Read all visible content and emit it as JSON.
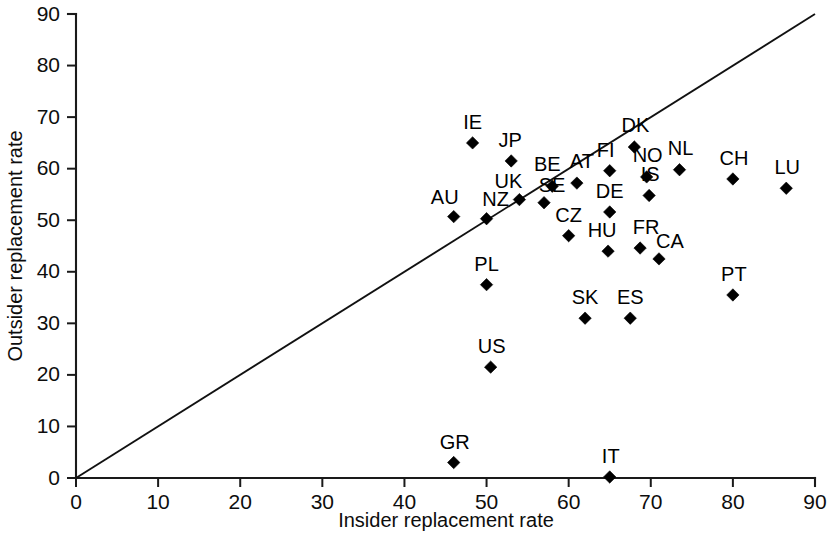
{
  "chart_data": {
    "type": "scatter",
    "title": "",
    "xlabel": "Insider replacement rate",
    "ylabel": "Outsider replacement rate",
    "xlim": [
      0,
      90
    ],
    "ylim": [
      0,
      90
    ],
    "xticks": [
      0,
      10,
      20,
      30,
      40,
      50,
      60,
      70,
      80,
      90
    ],
    "yticks": [
      0,
      10,
      20,
      30,
      40,
      50,
      60,
      70,
      80,
      90
    ],
    "grid": false,
    "legend": "none",
    "marker": "diamond",
    "marker_color": "#000000",
    "reference_line": {
      "description": "45-degree equality line",
      "from": [
        0,
        0
      ],
      "to": [
        90,
        90
      ],
      "color": "#111111"
    },
    "point_label_field": "label",
    "points": [
      {
        "label": "AU",
        "x": 46.0,
        "y": 50.7
      },
      {
        "label": "NZ",
        "x": 50.0,
        "y": 50.3
      },
      {
        "label": "IE",
        "x": 48.3,
        "y": 65.0
      },
      {
        "label": "JP",
        "x": 53.0,
        "y": 61.5
      },
      {
        "label": "UK",
        "x": 54.0,
        "y": 54.0
      },
      {
        "label": "SE",
        "x": 57.0,
        "y": 53.4
      },
      {
        "label": "BE",
        "x": 58.0,
        "y": 56.6
      },
      {
        "label": "AT",
        "x": 61.0,
        "y": 57.2
      },
      {
        "label": "CZ",
        "x": 60.0,
        "y": 47.0
      },
      {
        "label": "DK",
        "x": 68.0,
        "y": 64.2
      },
      {
        "label": "FI",
        "x": 65.0,
        "y": 59.6
      },
      {
        "label": "NO",
        "x": 69.5,
        "y": 58.4
      },
      {
        "label": "IS",
        "x": 69.8,
        "y": 54.8
      },
      {
        "label": "NL",
        "x": 73.5,
        "y": 59.8
      },
      {
        "label": "CH",
        "x": 80.0,
        "y": 58.0
      },
      {
        "label": "LU",
        "x": 86.5,
        "y": 56.2
      },
      {
        "label": "DE",
        "x": 65.0,
        "y": 51.6
      },
      {
        "label": "HU",
        "x": 64.8,
        "y": 44.0
      },
      {
        "label": "FR",
        "x": 68.7,
        "y": 44.6
      },
      {
        "label": "CA",
        "x": 71.0,
        "y": 42.5
      },
      {
        "label": "PL",
        "x": 50.0,
        "y": 37.5
      },
      {
        "label": "SK",
        "x": 62.0,
        "y": 31.0
      },
      {
        "label": "ES",
        "x": 67.5,
        "y": 31.0
      },
      {
        "label": "PT",
        "x": 80.0,
        "y": 35.5
      },
      {
        "label": "US",
        "x": 50.5,
        "y": 21.5
      },
      {
        "label": "GR",
        "x": 46.0,
        "y": 3.0
      },
      {
        "label": "IT",
        "x": 65.0,
        "y": 0.2
      }
    ],
    "label_offsets": {
      "AU": [
        -9,
        -13
      ],
      "NZ": [
        9,
        -13
      ],
      "IE": [
        0,
        -14
      ],
      "JP": [
        -1,
        -14
      ],
      "UK": [
        -11,
        -12
      ],
      "SE": [
        8,
        -11
      ],
      "BE": [
        -5,
        -15
      ],
      "AT": [
        5,
        -15
      ],
      "CZ": [
        0,
        -14
      ],
      "DK": [
        1,
        -15
      ],
      "FI": [
        -4,
        -14
      ],
      "NO": [
        1,
        -15
      ],
      "IS": [
        1,
        -14
      ],
      "NL": [
        1,
        -15
      ],
      "CH": [
        1,
        -14
      ],
      "LU": [
        1,
        -14
      ],
      "DE": [
        0,
        -14
      ],
      "HU": [
        -6,
        -14
      ],
      "FR": [
        6,
        -14
      ],
      "CA": [
        11,
        -11
      ],
      "PL": [
        0,
        -14
      ],
      "SK": [
        0,
        -14
      ],
      "ES": [
        0,
        -14
      ],
      "PT": [
        1,
        -14
      ],
      "US": [
        1,
        -14
      ],
      "GR": [
        1,
        -14
      ],
      "IT": [
        1,
        -14
      ]
    }
  }
}
